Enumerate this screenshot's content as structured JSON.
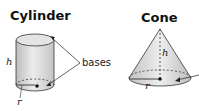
{
  "figures": [
    {
      "title": "Cylinder",
      "labels": {
        "height": "h",
        "radius": "r",
        "bases": "bases"
      }
    },
    {
      "title": "Cone",
      "labels": {
        "height": "h",
        "radius": "r"
      }
    }
  ],
  "colors": {
    "fill_light": "#e6e6e6",
    "fill_mid": "#cfcfcf",
    "stroke": "#333333"
  }
}
